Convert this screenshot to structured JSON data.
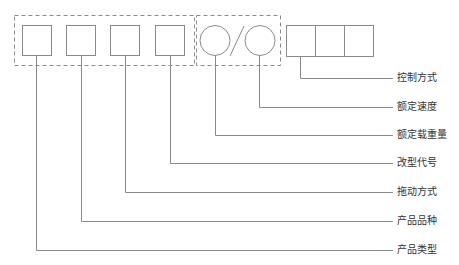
{
  "diagram": {
    "title": "",
    "groups": [
      {
        "name": "basic-code-group",
        "boxes": 4,
        "style": "dashed"
      },
      {
        "name": "rated-params-group",
        "circles": 2,
        "separator": "/",
        "style": "dashed"
      },
      {
        "name": "control-code-boxes",
        "boxes": 3
      }
    ],
    "labels": [
      {
        "id": "control",
        "text": "控制方式",
        "y": 78
      },
      {
        "id": "rated_speed",
        "text": "额定速度",
        "y": 107
      },
      {
        "id": "rated_load",
        "text": "额定载重量",
        "y": 135
      },
      {
        "id": "modification",
        "text": "改型代号",
        "y": 163
      },
      {
        "id": "drive",
        "text": "拖动方式",
        "y": 192
      },
      {
        "id": "product_variety",
        "text": "产品品种",
        "y": 221
      },
      {
        "id": "product_type",
        "text": "产品类型",
        "y": 250
      }
    ],
    "colors": {
      "line": "#8a8a8a",
      "text": "#333333",
      "background": "#ffffff"
    }
  }
}
